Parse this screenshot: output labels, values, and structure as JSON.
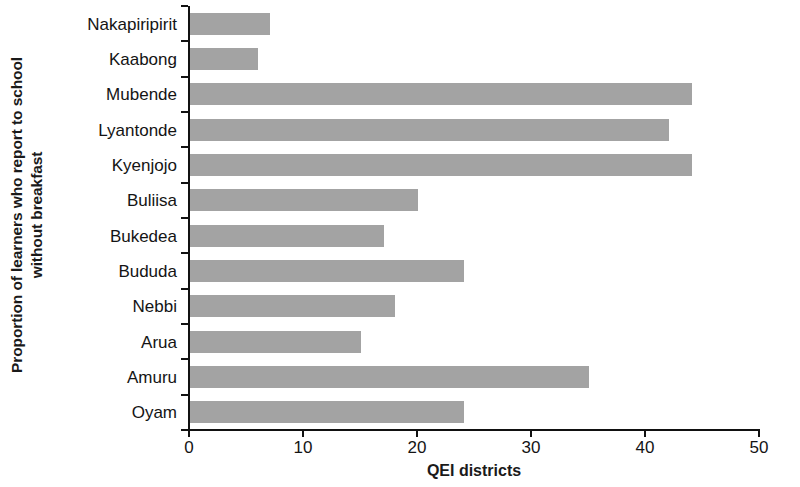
{
  "chart_data": {
    "type": "bar",
    "orientation": "horizontal",
    "title": "",
    "xlabel": "QEI districts",
    "ylabel": "Proportion of learners who report to school without breakfast",
    "ylabel_lines": [
      "Proportion of learners who report to school",
      "without breakfast"
    ],
    "categories": [
      "Nakapiripirit",
      "Kaabong",
      "Mubende",
      "Lyantonde",
      "Kyenjojo",
      "Buliisa",
      "Bukedea",
      "Bududa",
      "Nebbi",
      "Arua",
      "Amuru",
      "Oyam"
    ],
    "values": [
      7,
      6,
      44,
      42,
      44,
      20,
      17,
      24,
      18,
      15,
      35,
      24
    ],
    "xlim": [
      0,
      50
    ],
    "xticks": [
      0,
      10,
      20,
      30,
      40,
      50
    ],
    "xtick_labels": [
      "0",
      "10",
      "20",
      "30",
      "40",
      "50"
    ],
    "grid": false,
    "legend": null,
    "bar_color": "#a3a3a3",
    "axis_color": "#111111"
  }
}
